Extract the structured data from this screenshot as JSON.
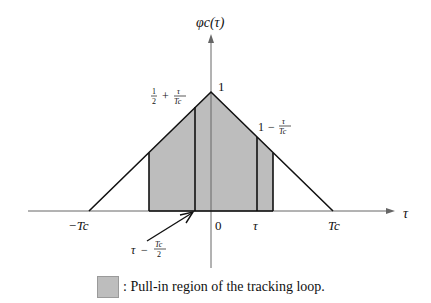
{
  "diagram": {
    "y_axis_label": "φc(τ)",
    "x_axis_label": "τ",
    "peak_label": "1",
    "x_ticks": {
      "neg_tc": "−Tc",
      "zero": "0",
      "tau": "τ",
      "tc": "Tc"
    },
    "annotations": {
      "left_value": "½ + τ/Tc",
      "left_value_parts": {
        "frac1_num": "1",
        "frac1_den": "2",
        "plus": "+",
        "frac2_num": "τ",
        "frac2_den": "Tc"
      },
      "right_value": "1 − τ/Tc",
      "right_value_parts": {
        "one": "1",
        "minus": "−",
        "frac_num": "τ",
        "frac_den": "Tc"
      },
      "arrow_label": "τ − Tc/2",
      "arrow_label_parts": {
        "tau": "τ",
        "minus": "−",
        "frac_num": "Tc",
        "frac_den": "2"
      }
    },
    "colors": {
      "shade": "#bdbdbd",
      "line": "#111111",
      "axis": "#555555"
    }
  },
  "legend": {
    "text": ": Pull-in region of the tracking loop."
  }
}
